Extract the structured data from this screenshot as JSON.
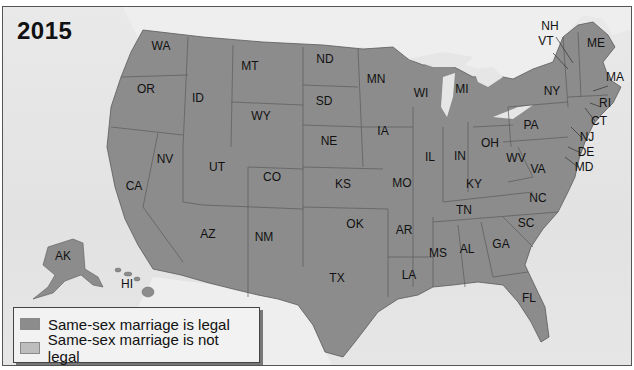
{
  "title": "2015",
  "colors": {
    "legal": "#8c8c8c",
    "not_legal": "#bdbdbd",
    "water": "#e4e4e4",
    "foreign_land": "#eeeeee",
    "border": "#555555"
  },
  "legend": {
    "items": [
      {
        "label": "Same-sex marriage is legal",
        "color": "#8c8c8c"
      },
      {
        "label": "Same-sex marriage is not legal",
        "color": "#bdbdbd"
      }
    ]
  },
  "states": [
    {
      "code": "WA",
      "x": 160,
      "y": 45
    },
    {
      "code": "OR",
      "x": 145,
      "y": 88
    },
    {
      "code": "ID",
      "x": 197,
      "y": 97
    },
    {
      "code": "MT",
      "x": 249,
      "y": 65
    },
    {
      "code": "WY",
      "x": 260,
      "y": 115
    },
    {
      "code": "ND",
      "x": 324,
      "y": 58
    },
    {
      "code": "SD",
      "x": 323,
      "y": 100
    },
    {
      "code": "MN",
      "x": 375,
      "y": 78
    },
    {
      "code": "WI",
      "x": 420,
      "y": 92
    },
    {
      "code": "MI",
      "x": 461,
      "y": 88
    },
    {
      "code": "NE",
      "x": 328,
      "y": 140
    },
    {
      "code": "IA",
      "x": 382,
      "y": 130
    },
    {
      "code": "IL",
      "x": 429,
      "y": 156
    },
    {
      "code": "IN",
      "x": 459,
      "y": 155
    },
    {
      "code": "OH",
      "x": 489,
      "y": 142
    },
    {
      "code": "NV",
      "x": 164,
      "y": 158
    },
    {
      "code": "UT",
      "x": 216,
      "y": 166
    },
    {
      "code": "CO",
      "x": 271,
      "y": 176
    },
    {
      "code": "CA",
      "x": 133,
      "y": 185
    },
    {
      "code": "KS",
      "x": 342,
      "y": 183
    },
    {
      "code": "MO",
      "x": 401,
      "y": 182
    },
    {
      "code": "KY",
      "x": 473,
      "y": 183
    },
    {
      "code": "WV",
      "x": 515,
      "y": 157
    },
    {
      "code": "VA",
      "x": 537,
      "y": 168
    },
    {
      "code": "PA",
      "x": 530,
      "y": 124
    },
    {
      "code": "NY",
      "x": 551,
      "y": 90
    },
    {
      "code": "NC",
      "x": 537,
      "y": 197
    },
    {
      "code": "TN",
      "x": 463,
      "y": 209
    },
    {
      "code": "SC",
      "x": 525,
      "y": 222
    },
    {
      "code": "AZ",
      "x": 207,
      "y": 233
    },
    {
      "code": "NM",
      "x": 263,
      "y": 236
    },
    {
      "code": "OK",
      "x": 354,
      "y": 223
    },
    {
      "code": "AR",
      "x": 403,
      "y": 229
    },
    {
      "code": "AL",
      "x": 466,
      "y": 248
    },
    {
      "code": "GA",
      "x": 500,
      "y": 243
    },
    {
      "code": "MS",
      "x": 437,
      "y": 252
    },
    {
      "code": "TX",
      "x": 336,
      "y": 277
    },
    {
      "code": "LA",
      "x": 408,
      "y": 274
    },
    {
      "code": "FL",
      "x": 528,
      "y": 297
    },
    {
      "code": "AK",
      "x": 62,
      "y": 255
    },
    {
      "code": "HI",
      "x": 126,
      "y": 283
    },
    {
      "code": "ME",
      "x": 595,
      "y": 42
    },
    {
      "code": "NH",
      "x": 549,
      "y": 25
    },
    {
      "code": "VT",
      "x": 545,
      "y": 40
    },
    {
      "code": "MA",
      "x": 614,
      "y": 76
    },
    {
      "code": "RI",
      "x": 604,
      "y": 102
    },
    {
      "code": "CT",
      "x": 598,
      "y": 120
    },
    {
      "code": "NJ",
      "x": 586,
      "y": 136
    },
    {
      "code": "DE",
      "x": 585,
      "y": 151
    },
    {
      "code": "MD",
      "x": 583,
      "y": 166
    }
  ]
}
